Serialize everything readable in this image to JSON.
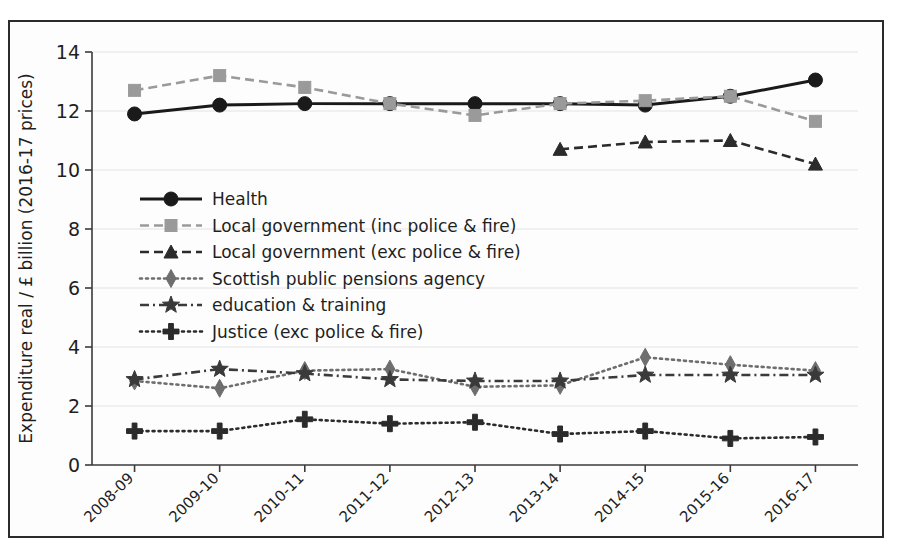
{
  "chart_data": {
    "type": "line",
    "title": "",
    "xlabel": "",
    "ylabel": "Expenditure real / £ billion (2016-17 prices)",
    "categories": [
      "2008-09",
      "2009-10",
      "2010-11",
      "2011-12",
      "2012-13",
      "2013-14",
      "2014-15",
      "2015-16",
      "2016-17"
    ],
    "ylim": [
      0,
      14
    ],
    "yticks": [
      0,
      2,
      4,
      6,
      8,
      10,
      12,
      14
    ],
    "ytick_labels": [
      "0",
      "2",
      "4",
      "6",
      "8",
      "10",
      "12",
      "14"
    ],
    "grid": true,
    "legend_position": "upper-left-inside",
    "series": [
      {
        "name": "Health",
        "marker": "circle",
        "color": "#1a1a1a",
        "dash": "none",
        "values": [
          11.9,
          12.2,
          12.25,
          12.25,
          12.25,
          12.25,
          12.2,
          12.5,
          13.05
        ]
      },
      {
        "name": "Local government (inc police & fire)",
        "marker": "square",
        "color": "#9a9a9a",
        "dash": "dashed",
        "values": [
          12.7,
          13.2,
          12.8,
          12.25,
          11.85,
          12.25,
          12.35,
          12.5,
          11.65
        ]
      },
      {
        "name": "Local government (exc police & fire)",
        "marker": "triangle",
        "color": "#2b2b2b",
        "dash": "dashed",
        "values": [
          null,
          null,
          null,
          null,
          null,
          10.7,
          10.95,
          11.0,
          10.2
        ]
      },
      {
        "name": "Scottish public pensions agency",
        "marker": "diamond",
        "color": "#6e6e6e",
        "dash": "dotted",
        "values": [
          2.85,
          2.6,
          3.2,
          3.25,
          2.65,
          2.7,
          3.65,
          3.4,
          3.2
        ]
      },
      {
        "name": "education & training",
        "marker": "star",
        "color": "#3a3a3a",
        "dash": "dashdot",
        "values": [
          2.9,
          3.25,
          3.1,
          2.9,
          2.85,
          2.85,
          3.05,
          3.05,
          3.05
        ]
      },
      {
        "name": "Justice (exc police & fire)",
        "marker": "plus",
        "color": "#2b2b2b",
        "dash": "dotted",
        "values": [
          1.15,
          1.15,
          1.55,
          1.4,
          1.45,
          1.05,
          1.15,
          0.9,
          0.95
        ]
      }
    ]
  },
  "colors": {
    "frame_border": "#2b2b2b",
    "background": "#fdfdfd",
    "grid": "#e3e3e3",
    "axis": "#3a3a3a"
  }
}
